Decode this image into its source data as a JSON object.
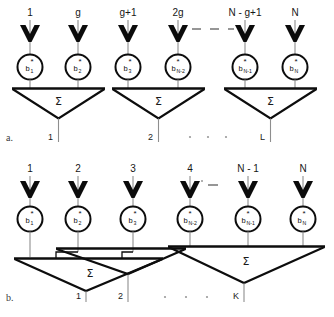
{
  "figure": {
    "panels": [
      {
        "id": "a",
        "label": "a.",
        "antenna_labels": [
          "1",
          "g",
          "g+1",
          "2g",
          "N - g+1",
          "N"
        ],
        "weight_base": "b",
        "weight_star": "*",
        "weight_subscripts": [
          "1",
          "2",
          "3",
          "N-2",
          "N-1",
          "N"
        ],
        "sum_symbol": "Σ",
        "output_labels": [
          "1",
          "2",
          "L"
        ],
        "ellipsis": "·  ·  ·"
      },
      {
        "id": "b",
        "label": "b.",
        "antenna_labels": [
          "1",
          "2",
          "3",
          "4",
          "N - 1",
          "N"
        ],
        "weight_base": "b",
        "weight_star": "*",
        "weight_subscripts": [
          "1",
          "2",
          "3",
          "N-2",
          "N-1",
          "N"
        ],
        "sum_symbol": "Σ",
        "output_labels": [
          "1",
          "2",
          "K"
        ],
        "ellipsis": "·  ·  ·"
      }
    ],
    "colors": {
      "ink": "#0d0d0d",
      "wire": "#8e8e8e",
      "muted": "#9a9a9a",
      "background": "#ffffff"
    }
  }
}
